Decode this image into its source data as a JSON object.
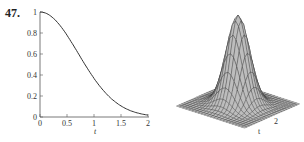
{
  "problem_number": "47.",
  "chart_data": [
    {
      "type": "line",
      "title": "",
      "xlabel": "t",
      "ylabel": "",
      "xlim": [
        0,
        2
      ],
      "ylim": [
        0,
        1
      ],
      "xticks": [
        "0",
        "0.5",
        "1",
        "1.5",
        "2"
      ],
      "yticks": [
        "0",
        "0.2",
        "0.4",
        "0.6",
        "0.8",
        "1"
      ],
      "x": [
        0,
        0.25,
        0.5,
        0.75,
        1.0,
        1.25,
        1.5,
        1.75,
        2.0
      ],
      "series": [
        {
          "name": "curve",
          "values": [
            1.0,
            0.94,
            0.78,
            0.58,
            0.38,
            0.22,
            0.11,
            0.05,
            0.02
          ]
        }
      ],
      "grid": false,
      "line_color": "#333333"
    },
    {
      "type": "surface",
      "title": "",
      "description": "3D wireframe surface of a single Gaussian bump peaking at center",
      "axis_labels": {
        "x": "t",
        "y": "2",
        "other": "2"
      },
      "peak_value": 1,
      "surface_color": "#bdbdbd",
      "mesh_color": "#333333"
    }
  ]
}
